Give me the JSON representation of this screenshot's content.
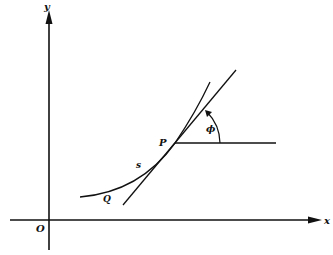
{
  "diagram": {
    "labels": {
      "y_axis": "y",
      "x_axis": "x",
      "origin": "O",
      "point_p": "P",
      "point_q": "Q",
      "arc_length": "s",
      "angle": "ϕ"
    },
    "colors": {
      "ink": "#111111",
      "background": "#ffffff"
    },
    "geometry": {
      "origin": [
        49,
        220
      ],
      "p": [
        175,
        143
      ],
      "q_curve_start": [
        80,
        197
      ],
      "curve_end": [
        210,
        82
      ],
      "tangent_start": [
        123,
        205
      ],
      "tangent_end": [
        236,
        70
      ],
      "horizontal_end": [
        276,
        143
      ]
    }
  }
}
